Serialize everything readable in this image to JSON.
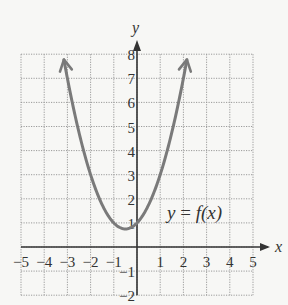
{
  "chart_data": {
    "type": "line",
    "title": "",
    "xlabel": "x",
    "ylabel": "y",
    "xlim": [
      -5,
      5
    ],
    "ylim": [
      -2,
      8
    ],
    "grid": true,
    "x_ticks": [
      -5,
      -4,
      -3,
      -2,
      -1,
      1,
      2,
      3,
      4,
      5
    ],
    "y_ticks": [
      -2,
      -1,
      1,
      2,
      3,
      4,
      5,
      6,
      7,
      8
    ],
    "annotation": "y = f(x)",
    "series": [
      {
        "name": "y = f(x)",
        "function": "x^2 + x + 1",
        "vertex": [
          -0.5,
          0.75
        ],
        "y_intercept": 1,
        "x_range": [
          -3.15,
          2.15
        ],
        "both_ends_arrows": true,
        "color": "#7a7a7a"
      }
    ]
  },
  "labels": {
    "x_axis": "x",
    "y_axis": "y",
    "function_label_y": "y",
    "function_label_eq": " = ",
    "function_label_f": "f(x)"
  }
}
